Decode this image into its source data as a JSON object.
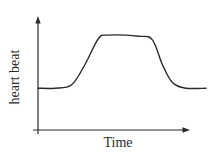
{
  "chart_data": {
    "type": "line",
    "title": "",
    "xlabel": "Time",
    "ylabel": "heart beat",
    "grid": false,
    "legend": null,
    "axis_ticks": "none",
    "note": "Qualitative sketch; no numeric ticks. Values are relative (0 = x-axis, 100 = top of y-axis arrow).",
    "x": [
      0,
      10,
      20,
      28,
      36,
      42,
      60,
      68,
      74,
      80,
      88,
      100
    ],
    "series": [
      {
        "name": "heart beat",
        "color": "#2a2a2a",
        "values": [
          37,
          37,
          40,
          58,
          81,
          84,
          83,
          80,
          58,
          42,
          37,
          37
        ]
      }
    ],
    "shape_description": "flat baseline, sigmoid rise to plateau, flat plateau, sigmoid fall back to baseline",
    "xlim": [
      0,
      100
    ],
    "ylim": [
      0,
      100
    ]
  },
  "colors": {
    "axis": "#2a2a2a",
    "curve": "#2a2a2a",
    "background": "#ffffff"
  }
}
